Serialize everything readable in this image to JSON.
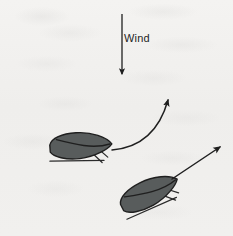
{
  "figure": {
    "width": 233,
    "height": 236,
    "background_color": "#f1f0ee",
    "ink_color": "#1f1f1f",
    "moth_body_color": "#585c5c",
    "moth_outline_color": "#1f1f1f"
  },
  "annotations": {
    "wind_label": "Wind"
  },
  "elements": {
    "wind_arrow": {
      "name": "wind-direction-arrow",
      "direction": "down",
      "x": 122,
      "y_start": 14,
      "y_end": 76
    },
    "moth_upper": {
      "name": "moth-upper",
      "orientation_degrees": -4,
      "center_x": 81,
      "center_y": 147
    },
    "moth_lower": {
      "name": "moth-lower",
      "orientation_degrees": -27,
      "center_x": 150,
      "center_y": 194
    },
    "curved_flight_arrow": {
      "name": "curved-flight-path-arrow",
      "start_x": 112,
      "start_y": 150,
      "end_x": 170,
      "end_y": 94
    },
    "straight_flight_arrow": {
      "name": "straight-flight-path-arrow",
      "start_x": 172,
      "start_y": 179,
      "end_x": 222,
      "end_y": 145
    }
  }
}
